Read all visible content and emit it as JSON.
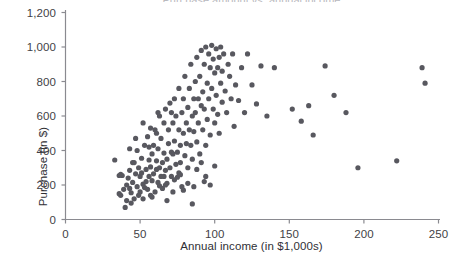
{
  "chart_data": {
    "type": "scatter",
    "title": "",
    "clipped_top_title": "Purchase amount vs. annual income",
    "xlabel": "Annual income (in $1,000s)",
    "ylabel": "Purchase (in $)",
    "xlim": [
      0,
      250
    ],
    "ylim": [
      0,
      1200
    ],
    "xticks": [
      0,
      50,
      100,
      150,
      200,
      250
    ],
    "xtick_labels": [
      "0",
      "50",
      "100",
      "150",
      "200",
      "250"
    ],
    "yticks": [
      0,
      200,
      400,
      600,
      800,
      1000,
      1200
    ],
    "ytick_labels": [
      "0",
      "200",
      "400",
      "600",
      "800",
      "1,000",
      "1,200"
    ],
    "grid": false,
    "legend": null,
    "marker": {
      "color": "#58585f",
      "size": 4.0,
      "shape": "circle"
    },
    "axis_color": "#8a8a90",
    "series": [
      {
        "name": "Customers",
        "points": [
          [
            33,
            345
          ],
          [
            37,
            262
          ],
          [
            38,
            255
          ],
          [
            36,
            150
          ],
          [
            37,
            140
          ],
          [
            40,
            70
          ],
          [
            41,
            200
          ],
          [
            42,
            240
          ],
          [
            43,
            285
          ],
          [
            43,
            180
          ],
          [
            44,
            155
          ],
          [
            45,
            330
          ],
          [
            45,
            215
          ],
          [
            46,
            120
          ],
          [
            47,
            265
          ],
          [
            48,
            400
          ],
          [
            48,
            190
          ],
          [
            49,
            300
          ],
          [
            50,
            250
          ],
          [
            50,
            160
          ],
          [
            51,
            355
          ],
          [
            52,
            205
          ],
          [
            52,
            120
          ],
          [
            53,
            430
          ],
          [
            54,
            290
          ],
          [
            54,
            220
          ],
          [
            55,
            480
          ],
          [
            55,
            175
          ],
          [
            56,
            250
          ],
          [
            56,
            345
          ],
          [
            57,
            305
          ],
          [
            57,
            140
          ],
          [
            58,
            380
          ],
          [
            58,
            225
          ],
          [
            59,
            430
          ],
          [
            59,
            265
          ],
          [
            60,
            160
          ],
          [
            60,
            520
          ],
          [
            61,
            290
          ],
          [
            61,
            340
          ],
          [
            62,
            215
          ],
          [
            62,
            410
          ],
          [
            63,
            300
          ],
          [
            63,
            600
          ],
          [
            64,
            250
          ],
          [
            64,
            470
          ],
          [
            65,
            330
          ],
          [
            65,
            180
          ],
          [
            66,
            560
          ],
          [
            66,
            385
          ],
          [
            67,
            285
          ],
          [
            67,
            640
          ],
          [
            68,
            350
          ],
          [
            68,
            210
          ],
          [
            69,
            440
          ],
          [
            69,
            520
          ],
          [
            70,
            300
          ],
          [
            70,
            675
          ],
          [
            71,
            390
          ],
          [
            71,
            250
          ],
          [
            72,
            560
          ],
          [
            72,
            160
          ],
          [
            73,
            455
          ],
          [
            73,
            700
          ],
          [
            74,
            320
          ],
          [
            74,
            600
          ],
          [
            75,
            390
          ],
          [
            75,
            245
          ],
          [
            76,
            520
          ],
          [
            76,
            760
          ],
          [
            77,
            430
          ],
          [
            77,
            330
          ],
          [
            78,
            620
          ],
          [
            78,
            190
          ],
          [
            79,
            500
          ],
          [
            79,
            700
          ],
          [
            80,
            370
          ],
          [
            80,
            830
          ],
          [
            81,
            560
          ],
          [
            81,
            440
          ],
          [
            82,
            650
          ],
          [
            82,
            300
          ],
          [
            83,
            520
          ],
          [
            83,
            760
          ],
          [
            84,
            430
          ],
          [
            84,
            900
          ],
          [
            85,
            600
          ],
          [
            85,
            350
          ],
          [
            86,
            700
          ],
          [
            86,
            510
          ],
          [
            87,
            800
          ],
          [
            87,
            620
          ],
          [
            88,
            450
          ],
          [
            88,
            940
          ],
          [
            89,
            700
          ],
          [
            89,
            560
          ],
          [
            90,
            830
          ],
          [
            90,
            380
          ],
          [
            91,
            660
          ],
          [
            91,
            980
          ],
          [
            92,
            740
          ],
          [
            92,
            520
          ],
          [
            93,
            900
          ],
          [
            93,
            640
          ],
          [
            94,
            430
          ],
          [
            94,
            1000
          ],
          [
            95,
            790
          ],
          [
            95,
            580
          ],
          [
            96,
            960
          ],
          [
            96,
            700
          ],
          [
            97,
            880
          ],
          [
            97,
            490
          ],
          [
            98,
            1010
          ],
          [
            98,
            760
          ],
          [
            99,
            640
          ],
          [
            99,
            930
          ],
          [
            100,
            850
          ],
          [
            100,
            560
          ],
          [
            101,
            990
          ],
          [
            101,
            720
          ],
          [
            102,
            610
          ],
          [
            102,
            880
          ],
          [
            103,
            940
          ],
          [
            103,
            500
          ],
          [
            104,
            790
          ],
          [
            104,
            1000
          ],
          [
            105,
            680
          ],
          [
            105,
            860
          ],
          [
            106,
            960
          ],
          [
            107,
            745
          ],
          [
            108,
            620
          ],
          [
            109,
            900
          ],
          [
            110,
            830
          ],
          [
            111,
            700
          ],
          [
            112,
            960
          ],
          [
            113,
            540
          ],
          [
            114,
            780
          ],
          [
            116,
            690
          ],
          [
            118,
            880
          ],
          [
            120,
            620
          ],
          [
            122,
            960
          ],
          [
            125,
            780
          ],
          [
            128,
            670
          ],
          [
            131,
            890
          ],
          [
            135,
            600
          ],
          [
            36,
            255
          ],
          [
            39,
            175
          ],
          [
            41,
            110
          ],
          [
            44,
            95
          ],
          [
            46,
            330
          ],
          [
            49,
            140
          ],
          [
            51,
            270
          ],
          [
            53,
            185
          ],
          [
            56,
            420
          ],
          [
            58,
            130
          ],
          [
            61,
            500
          ],
          [
            63,
            195
          ],
          [
            66,
            250
          ],
          [
            68,
            110
          ],
          [
            71,
            620
          ],
          [
            73,
            230
          ],
          [
            76,
            270
          ],
          [
            79,
            170
          ],
          [
            82,
            210
          ],
          [
            85,
            90
          ],
          [
            88,
            290
          ],
          [
            91,
            330
          ],
          [
            94,
            250
          ],
          [
            97,
            200
          ],
          [
            100,
            310
          ],
          [
            43,
            410
          ],
          [
            47,
            470
          ],
          [
            52,
            560
          ],
          [
            57,
            530
          ],
          [
            62,
            620
          ],
          [
            67,
            200
          ],
          [
            72,
            380
          ],
          [
            77,
            260
          ],
          [
            86,
            190
          ],
          [
            93,
            220
          ],
          [
            140,
            880
          ],
          [
            152,
            640
          ],
          [
            158,
            570
          ],
          [
            163,
            660
          ],
          [
            166,
            490
          ],
          [
            174,
            890
          ],
          [
            180,
            720
          ],
          [
            188,
            620
          ],
          [
            196,
            300
          ],
          [
            222,
            340
          ],
          [
            239,
            880
          ],
          [
            241,
            790
          ]
        ]
      }
    ]
  },
  "axes": {
    "y_title": "Purchase (in $)",
    "x_title": "Annual income (in $1,000s)"
  }
}
